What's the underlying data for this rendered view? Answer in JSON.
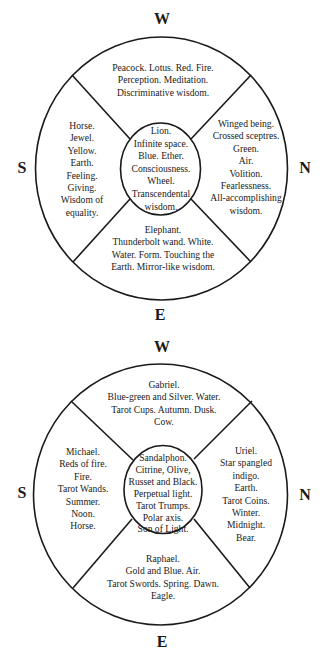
{
  "diagrams": [
    {
      "directions": {
        "top": "W",
        "left": "S",
        "right": "N",
        "bottom": "E"
      },
      "top": [
        "Peacock. Lotus. Red. Fire.",
        "Perception. Meditation.",
        "Discriminative wisdom."
      ],
      "left": [
        "Horse.",
        "Jewel.",
        "Yellow.",
        "Earth.",
        "Feeling.",
        "Giving.",
        "Wisdom of",
        "equality."
      ],
      "center": [
        "Lion.",
        "Infinite space.",
        "Blue. Ether.",
        "Consciousness.",
        "Wheel.",
        "Transcendental",
        "wisdom."
      ],
      "right": [
        "Winged being.",
        "Crossed sceptres.",
        "Green.",
        "Air.",
        "Volition.",
        "Fearlessness.",
        "All-accomplishing",
        "wisdom."
      ],
      "bottom": [
        "Elephant.",
        "Thunderbolt wand. White.",
        "Water. Form. Touching the",
        "Earth. Mirror-like wisdom."
      ]
    },
    {
      "directions": {
        "top": "W",
        "left": "S",
        "right": "N",
        "bottom": "E"
      },
      "top": [
        "Gabriel.",
        "Blue-green and Silver. Water.",
        "Tarot Cups. Autumn. Dusk.",
        "Cow."
      ],
      "left": [
        "Michael.",
        "Reds of fire.",
        "Fire.",
        "Tarot Wands.",
        "Summer.",
        "Noon.",
        "Horse."
      ],
      "center": [
        "Sandalphon.",
        "Citrine, Olive,",
        "Russet and Black.",
        "Perpetual light.",
        "Tarot Trumps.",
        "Polar axis.",
        "Son of Light."
      ],
      "right": [
        "Uriel.",
        "Star spangled",
        "indigo.",
        "Earth.",
        "Tarot Coins.",
        "Winter.",
        "Midnight.",
        "Bear."
      ],
      "bottom": [
        "Raphael.",
        "Gold and Blue. Air.",
        "Tarot Swords. Spring. Dawn.",
        "Eagle."
      ]
    }
  ]
}
